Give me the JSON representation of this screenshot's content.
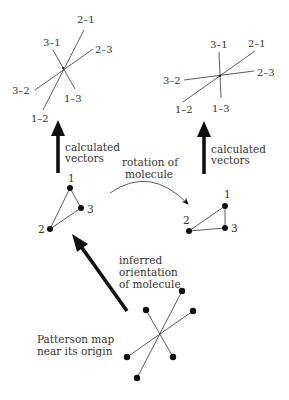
{
  "left_vectors": {
    "labels": {
      "v21": "2–1",
      "v12": "1–2",
      "v23": "2–3",
      "v32": "3–2",
      "v31": "3–1",
      "v13": "1–3"
    }
  },
  "right_vectors": {
    "labels": {
      "v21": "2–1",
      "v12": "1–2",
      "v23": "2–3",
      "v32": "3–2",
      "v31": "3–1",
      "v13": "1–3"
    }
  },
  "left_arrow": {
    "line1": "calculated",
    "line2": "vectors"
  },
  "right_arrow": {
    "line1": "calculated",
    "line2": "vectors"
  },
  "rotation": {
    "line1": "rotation of",
    "line2": "molecule"
  },
  "left_molecule": {
    "atoms": {
      "a1": "1",
      "a2": "2",
      "a3": "3"
    }
  },
  "right_molecule": {
    "atoms": {
      "a1": "1",
      "a2": "2",
      "a3": "3"
    }
  },
  "inferred": {
    "line1": "inferred",
    "line2": "orientation",
    "line3": "of molecule"
  },
  "patterson": {
    "line1": "Patterson map",
    "line2": "near its origin"
  },
  "colors": {
    "ink": "#111111",
    "text": "#333333",
    "background": "#ffffff"
  }
}
